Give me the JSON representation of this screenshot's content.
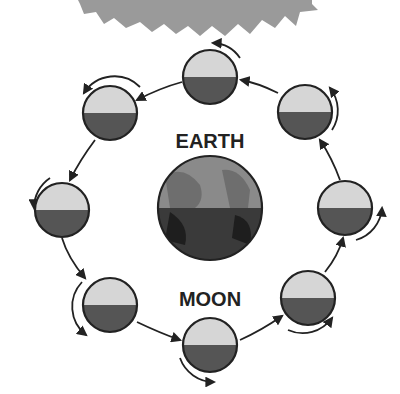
{
  "diagram": {
    "labels": {
      "earth": "EARTH",
      "moon": "MOON"
    },
    "colors": {
      "sun": "#9a9a9a",
      "moon_lit": "#d6d6d6",
      "moon_dark": "#555555",
      "earth_light": "#8a8a8a",
      "earth_dark": "#3a3a3a",
      "outline": "#222222",
      "arrow": "#222222"
    },
    "nodes": [
      {
        "id": "sun",
        "type": "sun"
      },
      {
        "id": "earth",
        "type": "planet",
        "label": "EARTH"
      },
      {
        "id": "moon-top",
        "type": "moon"
      },
      {
        "id": "moon-upper-right",
        "type": "moon"
      },
      {
        "id": "moon-right",
        "type": "moon"
      },
      {
        "id": "moon-lower-right",
        "type": "moon"
      },
      {
        "id": "moon-bottom",
        "type": "moon"
      },
      {
        "id": "moon-lower-left",
        "type": "moon"
      },
      {
        "id": "moon-left",
        "type": "moon"
      },
      {
        "id": "moon-upper-left",
        "type": "moon"
      }
    ],
    "orbit_direction": "counterclockwise"
  }
}
